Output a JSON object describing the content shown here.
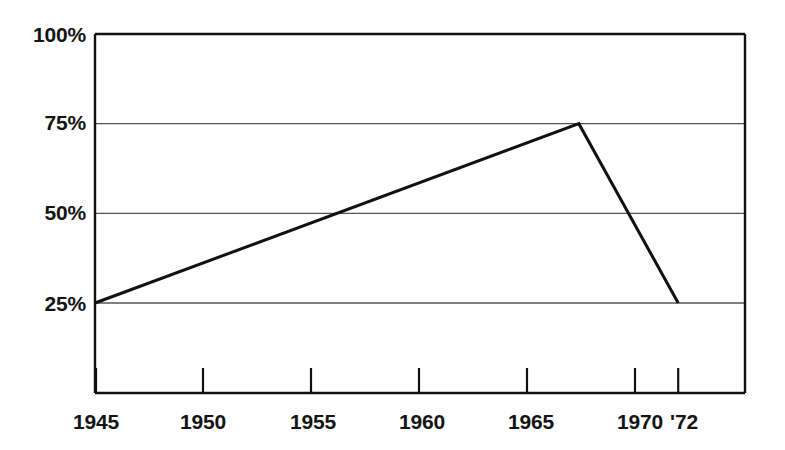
{
  "chart_data": {
    "type": "line",
    "title": "",
    "subtitle": "",
    "xlabel": "",
    "ylabel": "",
    "xlim": [
      1945,
      1973
    ],
    "ylim": [
      0,
      100
    ],
    "grid": true,
    "grid_axis": "y",
    "legend": "none",
    "series": [
      {
        "name": "",
        "x": [
          1945,
          1967.4,
          1972
        ],
        "values": [
          25,
          75,
          25
        ],
        "color": "#111111",
        "line_width": 3
      }
    ],
    "x_ticks": [
      {
        "value": 1945,
        "label": "1945"
      },
      {
        "value": 1950,
        "label": "1950"
      },
      {
        "value": 1955,
        "label": "1955"
      },
      {
        "value": 1960,
        "label": "1960"
      },
      {
        "value": 1965,
        "label": "1965"
      },
      {
        "value": 1970,
        "label": "1970"
      },
      {
        "value": 1972,
        "label": "'72"
      }
    ],
    "y_ticks": [
      {
        "value": 25,
        "label": "25%"
      },
      {
        "value": 50,
        "label": "50%"
      },
      {
        "value": 75,
        "label": "75%"
      },
      {
        "value": 100,
        "label": "100%"
      }
    ],
    "annotations": []
  },
  "style": {
    "background": "#ffffff",
    "frame_color": "#111111",
    "grid_color": "#555555",
    "data_color": "#111111",
    "text_color": "#141414"
  }
}
